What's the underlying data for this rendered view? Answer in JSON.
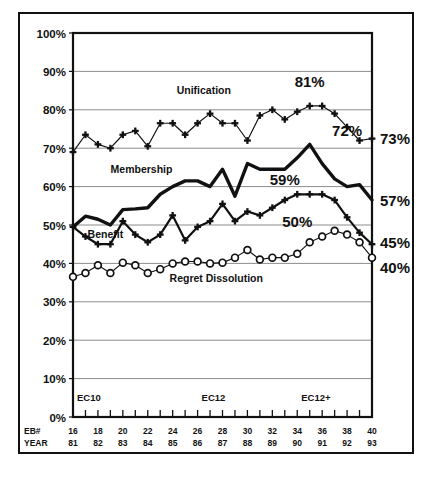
{
  "chart_data": {
    "type": "line",
    "title": "",
    "xlabel": "",
    "ylabel": "",
    "ylim": [
      0,
      100
    ],
    "grid": true,
    "legend": "inline-annotations",
    "y_ticks": [
      "0%",
      "10%",
      "20%",
      "30%",
      "40%",
      "50%",
      "60%",
      "70%",
      "80%",
      "90%",
      "100%"
    ],
    "y_tick_values": [
      0,
      10,
      20,
      30,
      40,
      50,
      60,
      70,
      80,
      90,
      100
    ],
    "x_axis_row_labels": [
      "EB#",
      "YEAR"
    ],
    "eb_numbers": [
      16,
      17,
      18,
      19,
      20,
      21,
      22,
      23,
      24,
      25,
      26,
      27,
      28,
      29,
      30,
      31,
      32,
      33,
      34,
      35,
      36,
      37,
      38,
      39,
      40
    ],
    "eb_tick_labels": [
      "16",
      "",
      "18",
      "",
      "20",
      "",
      "22",
      "",
      "24",
      "",
      "26",
      "",
      "28",
      "",
      "30",
      "",
      "32",
      "",
      "34",
      "",
      "36",
      "",
      "38",
      "",
      "40"
    ],
    "year_tick_labels": [
      "81",
      "",
      "82",
      "",
      "83",
      "",
      "84",
      "",
      "85",
      "",
      "86",
      "",
      "87",
      "",
      "88",
      "",
      "89",
      "",
      "90",
      "",
      "91",
      "",
      "92",
      "",
      "93"
    ],
    "era_bands": [
      {
        "label": "EC10",
        "start_eb": 16
      },
      {
        "label": "EC12",
        "start_eb": 26
      },
      {
        "label": "EC12+",
        "start_eb": 34
      }
    ],
    "series": [
      {
        "name": "Unification",
        "marker": "plus",
        "label_position": "top",
        "values": [
          69,
          73.5,
          71,
          70,
          73.5,
          74.5,
          70.5,
          76.5,
          76.5,
          73.5,
          76.5,
          79,
          76.5,
          76.5,
          72,
          78.5,
          80,
          77.5,
          79.5,
          81,
          81,
          79,
          75.5,
          72,
          72.5
        ],
        "callouts": [
          {
            "text": "81%",
            "eb": 35
          },
          {
            "text": "72%",
            "eb": 38
          }
        ],
        "end_label": "73%"
      },
      {
        "name": "Membership",
        "marker": "none",
        "label_position": "top",
        "values": [
          49.5,
          52.3,
          51.5,
          50,
          54,
          54.2,
          54.5,
          58,
          60,
          61.5,
          61.5,
          60,
          64.5,
          57.5,
          66,
          64.5,
          64.5,
          64.5,
          67.5,
          71,
          66,
          62,
          60,
          60.5,
          56.5
        ],
        "callouts": [
          {
            "text": "59%",
            "eb": 33
          }
        ],
        "end_label": "57%"
      },
      {
        "name": "Benefit",
        "marker": "plus",
        "label_position": "left",
        "values": [
          49.5,
          47,
          45,
          45,
          51,
          47.5,
          45.5,
          47.5,
          52.5,
          46,
          49.5,
          51,
          55.5,
          51,
          53.5,
          52.5,
          54.5,
          56.5,
          58,
          58,
          58,
          56.5,
          52,
          48,
          45
        ],
        "callouts": [
          {
            "text": "50%",
            "eb": 34
          }
        ],
        "end_label": "45%"
      },
      {
        "name": "Regret Dissolution",
        "marker": "circle",
        "label_position": "bottom",
        "values": [
          36.5,
          37.5,
          39.5,
          37.5,
          40.2,
          39.5,
          37.5,
          38.5,
          40,
          40.5,
          40.5,
          40,
          40.2,
          41.5,
          43.5,
          41,
          41.5,
          41.5,
          42.5,
          45.5,
          47,
          48.5,
          47.5,
          45.5,
          41.5,
          40
        ],
        "callouts": [],
        "end_label": "40%"
      }
    ],
    "series_labels": [
      {
        "name": "Unification",
        "x_eb": 26.5,
        "y_pct": 84
      },
      {
        "name": "Membership",
        "x_eb": 21.5,
        "y_pct": 63.5
      },
      {
        "name": "Benefit",
        "x_eb": 18.6,
        "y_pct": 46.6
      },
      {
        "name": "Regret Dissolution",
        "x_eb": 27.5,
        "y_pct": 35.2
      }
    ],
    "right_axis_labels": [
      {
        "text": "73%",
        "y_pct": 72.5
      },
      {
        "text": "57%",
        "y_pct": 56.5
      },
      {
        "text": "45%",
        "y_pct": 45.5
      },
      {
        "text": "40%",
        "y_pct": 39.0
      }
    ],
    "colors": {
      "line": "#111111",
      "grid": "#8c8c8c",
      "axis": "#111111",
      "background": "#ffffff"
    }
  }
}
